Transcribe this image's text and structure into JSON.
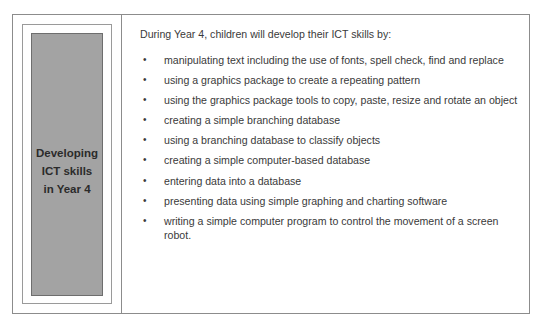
{
  "sidebar": {
    "title_lines": [
      "Developing",
      "ICT skills",
      "in Year 4"
    ]
  },
  "main": {
    "intro": "During Year 4, children will develop their ICT skills by:",
    "bullet_glyph": "•",
    "items": [
      "manipulating text including the use of fonts, spell check, find and replace",
      "using a graphics package to create a repeating pattern",
      "using the graphics package tools to copy, paste, resize and rotate an object",
      "creating a simple branching database",
      "using a branching database to classify objects",
      "creating a simple computer-based database",
      "entering data into a database",
      "presenting data using simple graphing and charting software",
      "writing a simple computer program to control the movement of a screen robot."
    ]
  },
  "colors": {
    "panel_fill": "#a3a3a3",
    "border": "#8c8c8c",
    "text": "#3a3a3a"
  }
}
